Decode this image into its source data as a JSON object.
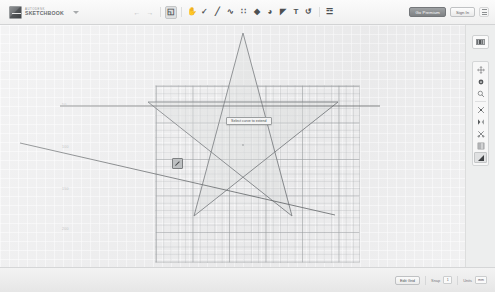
{
  "app": {
    "brand_line1": "AUTODESK",
    "brand_line2": "SKETCHBOOK",
    "document_caret": "▾"
  },
  "toolbar": {
    "undo_label": "←",
    "redo_label": "→",
    "items": [
      {
        "name": "select-tool",
        "glyph": "◱",
        "selected": true
      },
      {
        "name": "pan-tool",
        "glyph": "✋",
        "selected": false
      },
      {
        "name": "measure-tool",
        "glyph": "✓",
        "selected": false
      },
      {
        "name": "line-tool",
        "glyph": "╱",
        "selected": false
      },
      {
        "name": "curve-tool",
        "glyph": "∿",
        "selected": false
      },
      {
        "name": "grid-tool",
        "glyph": "∷",
        "selected": false
      },
      {
        "name": "shape-tool",
        "glyph": "◆",
        "selected": false
      },
      {
        "name": "fill-tool",
        "glyph": "◕",
        "selected": false
      },
      {
        "name": "brush-tool",
        "glyph": "◤",
        "selected": false
      },
      {
        "name": "text-tool",
        "glyph": "T",
        "selected": false
      },
      {
        "name": "rotate-tool",
        "glyph": "↺",
        "selected": false
      },
      {
        "name": "layers-tool",
        "glyph": "☲",
        "selected": false
      }
    ]
  },
  "topright": {
    "premium_label": "Go Premium",
    "signin_label": "Sign In",
    "menu_icon": "hamburger-menu-icon"
  },
  "canvas": {
    "tooltip": "Select curve to extend",
    "cursor_tool_icon": "pen-tool-icon",
    "ruler_ticks": [
      "50",
      "100",
      "150",
      "200"
    ]
  },
  "rightpanel": {
    "color_swatch_label": "color-palette-swatch",
    "tools": [
      {
        "name": "move-tool",
        "glyph": "✥",
        "selected": false
      },
      {
        "name": "rotate-view-tool",
        "glyph": "⭮",
        "selected": false
      },
      {
        "name": "zoom-tool",
        "glyph": "⌕",
        "selected": false
      },
      {
        "name": "scale-tool",
        "glyph": "⤢",
        "selected": false
      },
      {
        "name": "mirror-tool",
        "glyph": "◧",
        "selected": false
      },
      {
        "name": "trim-tool",
        "glyph": "✂",
        "selected": false
      },
      {
        "name": "offset-tool",
        "glyph": "⌸",
        "selected": false
      },
      {
        "name": "extend-tool",
        "glyph": "◥",
        "selected": true
      }
    ]
  },
  "bottombar": {
    "edit_grid_label": "Edit Grid",
    "snap_label": "Snap",
    "snap_value": "1",
    "units_label": "Units",
    "units_value": "mm"
  }
}
